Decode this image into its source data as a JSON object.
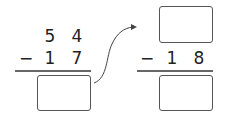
{
  "left_problem": {
    "top_digits": [
      "5",
      "4"
    ],
    "operator": "−",
    "bottom_digits": [
      "1",
      "7"
    ],
    "answer": ""
  },
  "right_problem": {
    "top_value": "",
    "operator": "−",
    "bottom_digits": [
      "1",
      "8"
    ],
    "answer": ""
  },
  "colors": {
    "ink": "#222222",
    "box_border": "#555555"
  }
}
